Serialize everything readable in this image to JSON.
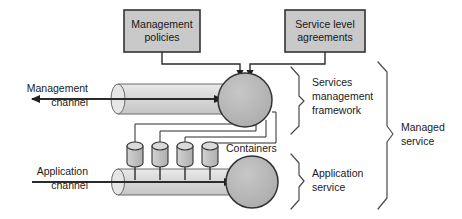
{
  "diagram": {
    "background_color": "#ffffff",
    "boxes": [
      {
        "id": "management-policies",
        "label_line1": "Management",
        "label_line2": "policies",
        "x": 124,
        "y": 10,
        "w": 76,
        "h": 42,
        "fill": "#c9c9c9",
        "stroke": "#333333"
      },
      {
        "id": "service-level-agreements",
        "label_line1": "Service level",
        "label_line2": "agreements",
        "x": 285,
        "y": 10,
        "w": 80,
        "h": 42,
        "fill": "#c9c9c9",
        "stroke": "#333333"
      }
    ],
    "nodes": [
      {
        "id": "services-management-framework-node",
        "shape": "circle",
        "cx": 245,
        "cy": 100,
        "r": 27,
        "fill": "#b8b8b8",
        "stroke": "#333333"
      },
      {
        "id": "application-service-node",
        "shape": "circle",
        "cx": 252,
        "cy": 182,
        "r": 26,
        "fill": "#b8b8b8",
        "stroke": "#333333"
      }
    ],
    "channels": [
      {
        "id": "management-channel",
        "label_line1": "Management",
        "label_line2": "channel",
        "label_x": 88,
        "label_y": 92,
        "pipe_x1": 112,
        "pipe_x2": 228,
        "pipe_top": 84,
        "pipe_bottom": 114,
        "fill": "#d6d6d6",
        "arrow_direction": "bidirectional",
        "arrow_left_x": 28,
        "arrow_right_x": 222,
        "arrow_y": 99
      },
      {
        "id": "application-channel",
        "label_line1": "Application",
        "label_line2": "channel",
        "label_x": 88,
        "label_y": 175,
        "pipe_x1": 112,
        "pipe_x2": 238,
        "pipe_top": 168,
        "pipe_bottom": 196,
        "fill": "#d6d6d6",
        "arrow_direction": "right",
        "arrow_left_x": 28,
        "arrow_right_x": 230,
        "arrow_y": 182
      }
    ],
    "containers": {
      "label": "Containers",
      "label_x": 199,
      "label_y": 148,
      "fill": "#c2c2c2",
      "stroke": "#333333",
      "cylinder_w": 16,
      "cylinder_body_h": 20,
      "cylinder_top": 143,
      "stem_bottom": 179,
      "items": [
        {
          "id": "container-1",
          "x": 127
        },
        {
          "id": "container-2",
          "x": 152
        },
        {
          "id": "container-3",
          "x": 177
        },
        {
          "id": "container-4",
          "x": 202
        }
      ]
    },
    "braces": [
      {
        "id": "services-management-framework-brace",
        "label_line1": "Services",
        "label_line2": "management",
        "label_line3": "framework",
        "label_x": 318,
        "label_y": 83,
        "x": 296,
        "y_top": 68,
        "y_bottom": 133,
        "depth": 9
      },
      {
        "id": "application-service-brace",
        "label_line1": "Application",
        "label_line2": "service",
        "label_line3": "",
        "label_x": 318,
        "label_y": 175,
        "x": 296,
        "y_top": 155,
        "y_bottom": 210,
        "depth": 9
      },
      {
        "id": "managed-service-brace",
        "label_line1": "Managed",
        "label_line2": "service",
        "label_line3": "",
        "label_x": 400,
        "label_y": 128,
        "x": 384,
        "y_top": 63,
        "y_bottom": 210,
        "depth": 10
      }
    ],
    "connectors": {
      "policy_drop_x": 162,
      "policy_drop_y": 52,
      "sla_drop_x": 325,
      "sla_drop_y": 52,
      "bus_y": 64,
      "arrow_left_x": 240,
      "arrow_right_x": 250,
      "arrow_tip_y": 73,
      "container_links": [
        {
          "from_x": 248,
          "to_x": 135,
          "y": 124
        },
        {
          "from_x": 256,
          "to_x": 160,
          "y": 131
        },
        {
          "from_x": 266,
          "to_x": 185,
          "y": 137
        },
        {
          "from_x": 276,
          "to_x": 210,
          "y": 143
        }
      ]
    }
  }
}
